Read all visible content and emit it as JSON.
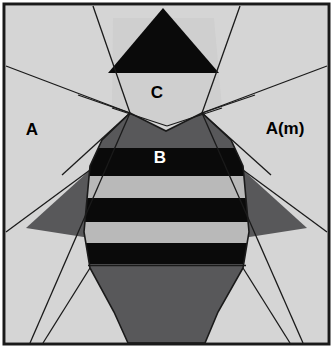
{
  "figure": {
    "canvas": {
      "width": 333,
      "height": 348
    },
    "colors": {
      "background": "#ffffff",
      "light_gray": "#d5d5d5",
      "pale_gray": "#cfcfcf",
      "mid_gray": "#b9b9b9",
      "dark_gray": "#58585a",
      "black": "#0a0a0a",
      "outline": "#1a1a1a",
      "label_dark": "#000000",
      "label_light": "#ffffff"
    },
    "frame": {
      "x": 4,
      "y": 4,
      "width": 325,
      "height": 340,
      "stroke_width": 3
    },
    "labels": [
      {
        "id": "label-a",
        "text": "A",
        "x": 32,
        "y": 135,
        "color": "#000000",
        "size": 17
      },
      {
        "id": "label-a-m",
        "text": "A(m)",
        "x": 259,
        "y": 134,
        "color": "#000000",
        "size": 17
      },
      {
        "id": "label-c",
        "text": "C",
        "x": 157,
        "y": 98,
        "color": "#000000",
        "size": 17
      },
      {
        "id": "label-b",
        "text": "B",
        "x": 160,
        "y": 163,
        "color": "#ffffff",
        "size": 17
      }
    ],
    "regions": [
      {
        "id": "region-background-left",
        "name": "left-outer-region-a",
        "fill": "light_gray"
      },
      {
        "id": "region-background-right",
        "name": "right-outer-region-a-mirror",
        "fill": "light_gray"
      },
      {
        "id": "region-c-panel",
        "name": "region-c-panel",
        "fill": "mid_gray"
      },
      {
        "id": "region-top-triangle",
        "name": "black-apex-triangle",
        "fill": "black"
      },
      {
        "id": "region-body",
        "name": "central-body-shield",
        "fill": "dark_gray"
      },
      {
        "id": "region-left-wing",
        "name": "left-dark-wing-triangle",
        "fill": "dark_gray"
      },
      {
        "id": "region-right-wing",
        "name": "right-dark-wing-triangle",
        "fill": "dark_gray"
      }
    ],
    "stripes": [
      {
        "id": "stripe-1",
        "name": "black-band-1",
        "fill": "black",
        "y_top": 148,
        "y_bottom": 176
      },
      {
        "id": "stripe-2",
        "name": "gray-band-1",
        "fill": "mid_gray",
        "y_top": 176,
        "y_bottom": 198
      },
      {
        "id": "stripe-3",
        "name": "black-band-2",
        "fill": "black",
        "y_top": 198,
        "y_bottom": 222
      },
      {
        "id": "stripe-4",
        "name": "gray-band-2",
        "fill": "mid_gray",
        "y_top": 222,
        "y_bottom": 243
      },
      {
        "id": "stripe-5",
        "name": "black-band-3",
        "fill": "black",
        "y_top": 243,
        "y_bottom": 264
      }
    ],
    "divider_lines": [
      {
        "id": "line-left-upper-diagonal",
        "name": "left-upper-diagonal"
      },
      {
        "id": "line-left-mid-diagonal",
        "name": "left-mid-diagonal"
      },
      {
        "id": "line-left-fan-a",
        "name": "left-fan-line-a"
      },
      {
        "id": "line-left-fan-b",
        "name": "left-fan-line-b"
      },
      {
        "id": "line-left-lower-diagonal",
        "name": "left-lower-diagonal"
      },
      {
        "id": "line-right-upper-diagonal",
        "name": "right-upper-diagonal"
      },
      {
        "id": "line-right-mid-diagonal",
        "name": "right-mid-diagonal"
      },
      {
        "id": "line-right-fan-a",
        "name": "right-fan-line-a"
      },
      {
        "id": "line-right-fan-b",
        "name": "right-fan-line-b"
      },
      {
        "id": "line-right-lower-diagonal",
        "name": "right-lower-diagonal"
      }
    ]
  }
}
